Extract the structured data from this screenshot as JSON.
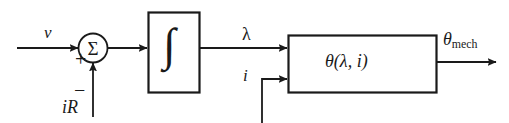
{
  "diagram": {
    "colors": {
      "line": "#1a1a1a",
      "background": "#ffffff",
      "text": "#1a1a1a"
    },
    "labels": {
      "voltage_input": "v",
      "sum_plus": "+",
      "sum_minus": "−",
      "resistive_drop": "iR",
      "flux_linkage": "λ",
      "current_input": "i",
      "torque_function": "θ(λ, i)",
      "mech_output_symbol": "θ",
      "mech_output_subscript": "mech",
      "integrator_symbol": "∫",
      "summing_symbol": "Σ"
    },
    "blocks": [
      {
        "name": "summing-junction",
        "shape": "circle",
        "label": "Σ"
      },
      {
        "name": "integrator-block",
        "shape": "rectangle",
        "label": "∫"
      },
      {
        "name": "theta-block",
        "shape": "rectangle",
        "label": "θ(λ, i)"
      }
    ],
    "signals": [
      {
        "name": "input-voltage",
        "label": "v",
        "sign": "+"
      },
      {
        "name": "feedback-ir",
        "label": "iR",
        "sign": "−"
      },
      {
        "name": "flux-linkage",
        "label": "λ"
      },
      {
        "name": "current",
        "label": "i"
      },
      {
        "name": "mechanical-angle",
        "label": "θmech"
      }
    ]
  }
}
